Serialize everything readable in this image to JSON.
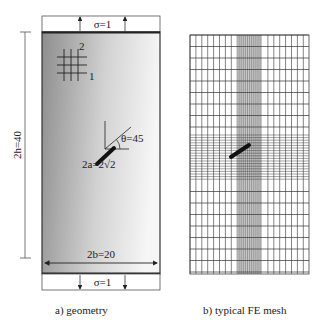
{
  "panel_a": {
    "caption": "a) geometry",
    "top_load_label": "σ=1",
    "bottom_load_label": "σ=1",
    "height_label": "2h=40",
    "width_label": "2b=20",
    "crack_length_label": "2a=2√2",
    "crack_angle_label": "θ=45",
    "axis_1_label": "1",
    "axis_2_label": "2",
    "plate_gradient": [
      "#8f8f8f",
      "#f4f4f4"
    ]
  },
  "panel_b": {
    "caption": "b) typical FE mesh",
    "mesh_color": "#333333",
    "dense_band_color": "#9a9a9a"
  }
}
